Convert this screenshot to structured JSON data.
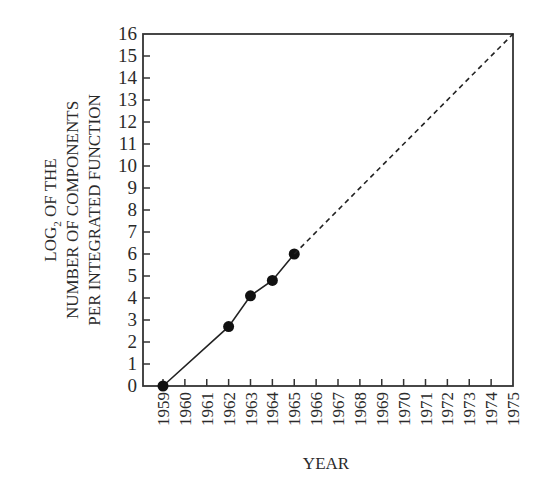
{
  "chart_data": {
    "type": "line",
    "title": "",
    "xlabel": "YEAR",
    "ylabel_lines": [
      "LOG2 OF THE",
      "NUMBER OF COMPONENTS",
      "PER INTEGRATED FUNCTION"
    ],
    "ylabel": "LOG2 OF THE NUMBER OF COMPONENTS PER INTEGRATED FUNCTION",
    "xlim": [
      1959,
      1975
    ],
    "ylim": [
      0,
      16
    ],
    "x_ticks": [
      1959,
      1960,
      1961,
      1962,
      1963,
      1964,
      1965,
      1966,
      1967,
      1968,
      1969,
      1970,
      1971,
      1972,
      1973,
      1974,
      1975
    ],
    "y_ticks": [
      0,
      1,
      2,
      3,
      4,
      5,
      6,
      7,
      8,
      9,
      10,
      11,
      12,
      13,
      14,
      15,
      16
    ],
    "grid": false,
    "legend": null,
    "series": [
      {
        "name": "Observed",
        "style": "solid with markers",
        "x": [
          1959,
          1962,
          1963,
          1964,
          1965
        ],
        "y": [
          0,
          2.7,
          4.1,
          4.8,
          6.0
        ]
      },
      {
        "name": "Extrapolation",
        "style": "dashed",
        "x": [
          1965,
          1975
        ],
        "y": [
          6.0,
          16
        ]
      }
    ]
  },
  "labels": {
    "ylabel_line1_prefix": "LOG",
    "ylabel_line1_sub": "2",
    "ylabel_line1_suffix": " OF THE",
    "ylabel_line2": "NUMBER OF COMPONENTS",
    "ylabel_line3": "PER INTEGRATED FUNCTION",
    "xlabel": "YEAR"
  },
  "colors": {
    "axis": "#333333",
    "line": "#222222",
    "marker": "#111111",
    "text": "#2a2a2a"
  }
}
